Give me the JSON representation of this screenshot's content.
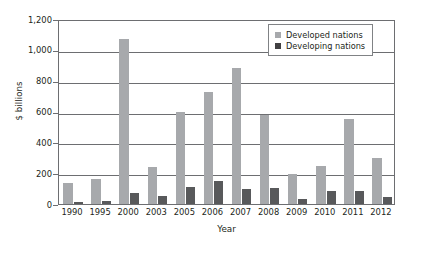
{
  "chart_data": {
    "type": "bar",
    "title": "",
    "xlabel": "Year",
    "ylabel": "$ billions",
    "categories": [
      "1990",
      "1995",
      "2000",
      "2003",
      "2005",
      "2006",
      "2007",
      "2008",
      "2009",
      "2010",
      "2011",
      "2012"
    ],
    "series": [
      {
        "name": "Developed nations",
        "color": "#a7a9ac",
        "values": [
          135,
          165,
          1070,
          240,
          600,
          725,
          885,
          580,
          195,
          245,
          550,
          300
        ]
      },
      {
        "name": "Developing nations",
        "color": "#58595b",
        "values": [
          15,
          18,
          70,
          50,
          110,
          150,
          100,
          103,
          35,
          82,
          85,
          45
        ]
      }
    ],
    "ylim": [
      0,
      1200
    ],
    "yticks": [
      0,
      200,
      400,
      600,
      800,
      1000,
      1200
    ],
    "ytick_labels": [
      "0",
      "200",
      "400",
      "600",
      "800",
      "1,000",
      "1,200"
    ],
    "grid": "horizontal",
    "legend_position": "top-right"
  },
  "axes": {
    "y_title": "$ billions",
    "x_title": "Year"
  },
  "legend": {
    "items": [
      {
        "label": "Developed nations",
        "swatch": "developed"
      },
      {
        "label": "Developing nations",
        "swatch": "developing"
      }
    ]
  }
}
